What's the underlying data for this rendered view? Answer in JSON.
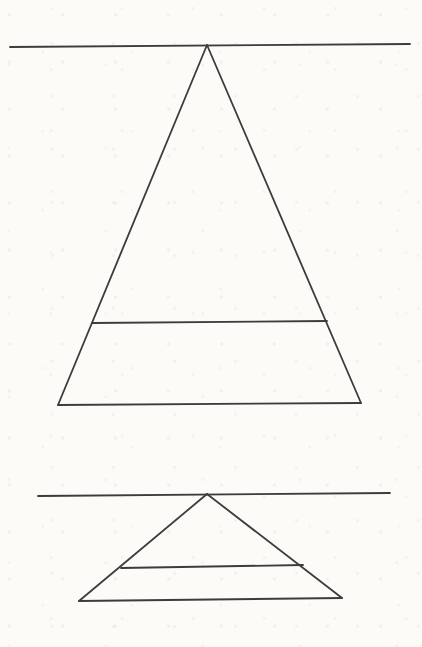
{
  "page": {
    "background_color": "#fcfbf8",
    "line_color": "#3c3c3c",
    "line_width": 1.8,
    "width": 422,
    "height": 647
  },
  "figures": [
    {
      "name": "upper-triangle-figure",
      "description": "large triangle hanging from a long horizontal line at its apex, with an internal horizontal line cutting off a bottom trapezoid",
      "lines": [
        {
          "name": "horizon-line",
          "x1": 10,
          "y1": 47,
          "x2": 410,
          "y2": 44
        },
        {
          "name": "triangle-left-side",
          "x1": 207,
          "y1": 45,
          "x2": 58,
          "y2": 405
        },
        {
          "name": "triangle-right-side",
          "x1": 207,
          "y1": 45,
          "x2": 361,
          "y2": 403
        },
        {
          "name": "triangle-base",
          "x1": 58,
          "y1": 405,
          "x2": 361,
          "y2": 403
        },
        {
          "name": "inner-horizontal-line",
          "x1": 92,
          "y1": 323,
          "x2": 327,
          "y2": 321
        }
      ]
    },
    {
      "name": "lower-triangle-figure",
      "description": "smaller flatter triangle hanging from a long horizontal line at its apex, with an internal horizontal line cutting off a bottom trapezoid",
      "lines": [
        {
          "name": "horizon-line",
          "x1": 38,
          "y1": 496,
          "x2": 390,
          "y2": 493
        },
        {
          "name": "triangle-left-side",
          "x1": 207,
          "y1": 494,
          "x2": 79,
          "y2": 601
        },
        {
          "name": "triangle-right-side",
          "x1": 207,
          "y1": 494,
          "x2": 342,
          "y2": 598
        },
        {
          "name": "triangle-base",
          "x1": 79,
          "y1": 601,
          "x2": 342,
          "y2": 598
        },
        {
          "name": "inner-horizontal-line",
          "x1": 121,
          "y1": 568,
          "x2": 303,
          "y2": 565
        }
      ]
    }
  ]
}
